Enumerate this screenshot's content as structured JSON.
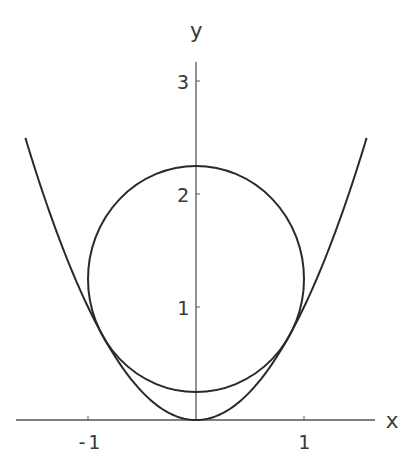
{
  "chart_data": {
    "type": "line",
    "title": "",
    "xlabel": "x",
    "ylabel": "y",
    "xlim": [
      -1.68,
      1.65
    ],
    "ylim": [
      0,
      3.15
    ],
    "grid": false,
    "legend": null,
    "x_ticks": [
      {
        "value": -1,
        "label": "-1"
      },
      {
        "value": 1,
        "label": "1"
      }
    ],
    "y_ticks": [
      {
        "value": 1,
        "label": "1"
      },
      {
        "value": 2,
        "label": "2"
      },
      {
        "value": 3,
        "label": "3"
      }
    ],
    "series": [
      {
        "name": "parabola",
        "equation": "y = x^2",
        "x_range": [
          -1.58,
          1.58
        ],
        "color": "#2a2a2a"
      },
      {
        "name": "circle",
        "equation": "x^2 + (y - 1.25)^2 = 1",
        "center": [
          0,
          1.25
        ],
        "radius": 1,
        "color": "#2a2a2a"
      }
    ],
    "annotations": [
      "circle tangent to parabola at x = ±0.866, y = 0.75"
    ]
  },
  "axes": {
    "x_label": "x",
    "y_label": "y",
    "x_tick_labels": [
      "-1",
      "1"
    ],
    "y_tick_labels": [
      "1",
      "2",
      "3"
    ]
  }
}
